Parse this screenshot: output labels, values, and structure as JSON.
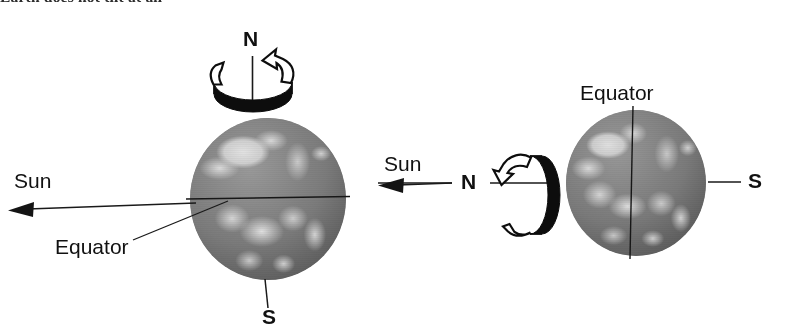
{
  "caption": {
    "text": "Earth does not tilt at all"
  },
  "figure": {
    "background_color": "#ffffff",
    "ink_color": "#111111",
    "globe_color": "#7d7d7d"
  },
  "left_diagram": {
    "name": "side-view-earth",
    "north_pole_label": "N",
    "south_pole_label": "S",
    "sun_label": "Sun",
    "equator_label": "Equator",
    "rotation_symbol": "counterclockwise-rotation-band-horizontal",
    "equator_orientation": "horizontal",
    "axis_orientation": "vertical"
  },
  "right_diagram": {
    "name": "pole-view-earth",
    "north_pole_label": "N",
    "south_pole_label": "S",
    "sun_label": "Sun",
    "equator_label": "Equator",
    "rotation_symbol": "rotation-band-vertical",
    "equator_orientation": "vertical",
    "axis_orientation": "horizontal"
  }
}
